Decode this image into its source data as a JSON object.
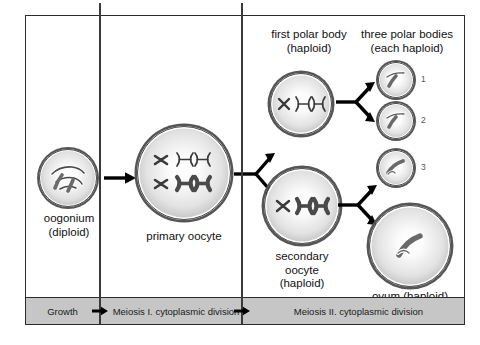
{
  "diagram": {
    "stages": [
      {
        "id": "oogonium",
        "label": "oogonium\n(diploid)"
      },
      {
        "id": "primary-oocyte",
        "label": "primary oocyte"
      },
      {
        "id": "first-polar-body",
        "label": "first polar body\n(haploid)"
      },
      {
        "id": "three-polar-bodies",
        "label": "three polar bodies\n(each haploid)"
      },
      {
        "id": "secondary-oocyte",
        "label": "secondary\noocyte\n(haploid)"
      },
      {
        "id": "ovum",
        "label": "ovum (haploid)"
      }
    ],
    "labels": {
      "oogonium_line1": "oogonium",
      "oogonium_line2": "(diploid)",
      "primary_oocyte": "primary oocyte",
      "first_polar_body_line1": "first polar body",
      "first_polar_body_line2": "(haploid)",
      "three_polar_bodies_line1": "three polar bodies",
      "three_polar_bodies_line2": "(each haploid)",
      "secondary_oocyte_line1": "secondary",
      "secondary_oocyte_line2": "oocyte",
      "secondary_oocyte_line3": "(haploid)",
      "ovum": "ovum (haploid)"
    },
    "polar_body_numbers": [
      "1",
      "2",
      "3"
    ],
    "timeline": {
      "phases": [
        {
          "id": "growth",
          "label": "Growth"
        },
        {
          "id": "meiosis-1",
          "label": "Meiosis I. cytoplasmic division"
        },
        {
          "id": "meiosis-2",
          "label": "Meiosis II. cytoplasmic division"
        }
      ]
    },
    "colors": {
      "frame": "#2b2b2b",
      "timeline_bg": "#c6c6c6",
      "cell_border": "#4a4a4a",
      "chromosome_dark": "#5a5a5a",
      "chromosome_light": "#ffffff",
      "arrow": "#000000"
    }
  }
}
